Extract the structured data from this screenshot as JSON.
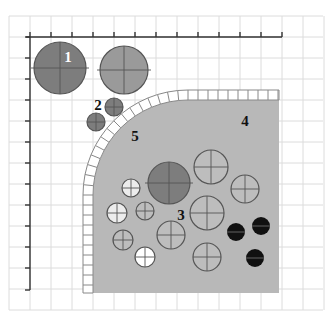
{
  "diagram": {
    "type": "schematic-grid-diagram",
    "grid": {
      "spacing": 21,
      "origin_x": 9,
      "origin_y": 16,
      "color": "#dcdcdc"
    },
    "axes": {
      "origin": [
        30,
        37
      ],
      "x_end": 282,
      "y_end": 290,
      "x_ticks": [
        30,
        51,
        72,
        93,
        114,
        135,
        156,
        177,
        198,
        219,
        240,
        261,
        282
      ],
      "y_ticks": [
        37,
        58,
        79,
        100,
        121,
        142,
        163,
        184,
        205,
        226,
        247,
        268,
        290
      ],
      "color": "#333333"
    },
    "colors": {
      "region_fill": "#b8b8b8",
      "dark_circle": "#7d7d7d",
      "mid_circle": "#9a9a9a",
      "light_circle": "#bdbdbd",
      "pale_circle": "#ececec",
      "white_circle": "#ffffff",
      "black_circle": "#111111",
      "border_tile": "#ffffff",
      "outline": "#555555"
    },
    "labels": [
      {
        "id": "1",
        "text": "1",
        "x": 68,
        "y": 62,
        "color": "#ffffff"
      },
      {
        "id": "2",
        "text": "2",
        "x": 98,
        "y": 110,
        "color": "#111111"
      },
      {
        "id": "3",
        "text": "3",
        "x": 181,
        "y": 220,
        "color": "#111111"
      },
      {
        "id": "4",
        "text": "4",
        "x": 245,
        "y": 126,
        "color": "#111111"
      },
      {
        "id": "5",
        "text": "5",
        "x": 135,
        "y": 141,
        "color": "#111111"
      }
    ],
    "group1_circles": [
      {
        "cx": 60,
        "cy": 68,
        "r": 26,
        "fill": "dark"
      },
      {
        "cx": 124,
        "cy": 70,
        "r": 24,
        "fill": "mid"
      }
    ],
    "group2_circles": [
      {
        "cx": 114,
        "cy": 107,
        "r": 9,
        "fill": "dark"
      },
      {
        "cx": 96,
        "cy": 122,
        "r": 9,
        "fill": "dark"
      }
    ],
    "group3_circles": [
      {
        "cx": 169,
        "cy": 183,
        "r": 21,
        "fill": "dark"
      },
      {
        "cx": 211,
        "cy": 167,
        "r": 17,
        "fill": "light"
      },
      {
        "cx": 245,
        "cy": 189,
        "r": 14,
        "fill": "light"
      },
      {
        "cx": 131,
        "cy": 188,
        "r": 9,
        "fill": "pale"
      },
      {
        "cx": 117,
        "cy": 213,
        "r": 10,
        "fill": "pale"
      },
      {
        "cx": 145,
        "cy": 211,
        "r": 9,
        "fill": "light"
      },
      {
        "cx": 207,
        "cy": 213,
        "r": 17,
        "fill": "light"
      },
      {
        "cx": 171,
        "cy": 235,
        "r": 14,
        "fill": "light"
      },
      {
        "cx": 123,
        "cy": 240,
        "r": 10,
        "fill": "light"
      },
      {
        "cx": 145,
        "cy": 257,
        "r": 10,
        "fill": "white"
      },
      {
        "cx": 207,
        "cy": 257,
        "r": 14,
        "fill": "light"
      }
    ],
    "black_circles": [
      {
        "cx": 236,
        "cy": 232,
        "r": 9
      },
      {
        "cx": 261,
        "cy": 226,
        "r": 9
      },
      {
        "cx": 255,
        "cy": 258,
        "r": 9
      }
    ],
    "region4": {
      "x": 93,
      "y": 100,
      "right": 279,
      "bottom": 293,
      "corner_radius": 95
    },
    "region5_band": {
      "width": 10,
      "tile_size": 10
    }
  }
}
